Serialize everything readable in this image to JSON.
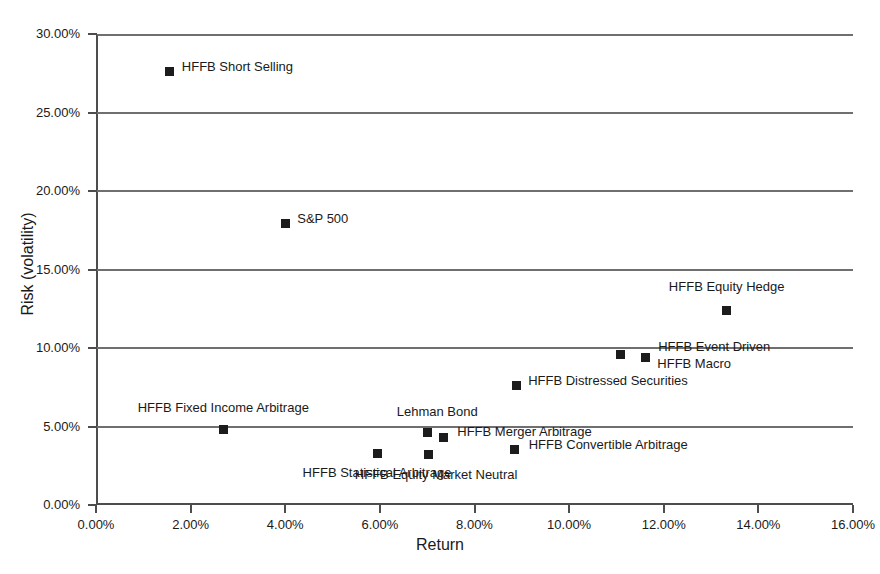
{
  "chart_data": {
    "type": "scatter",
    "title": "",
    "xlabel": "Return",
    "ylabel": "Risk (volatility)",
    "xlim": [
      0,
      16
    ],
    "ylim": [
      0,
      30
    ],
    "grid": "horizontal",
    "legend": "none",
    "x_tick_labels": [
      "0.00%",
      "2.00%",
      "4.00%",
      "6.00%",
      "8.00%",
      "10.00%",
      "12.00%",
      "14.00%",
      "16.00%"
    ],
    "x_tick_values": [
      0,
      2,
      4,
      6,
      8,
      10,
      12,
      14,
      16
    ],
    "y_tick_labels": [
      "0.00%",
      "5.00%",
      "10.00%",
      "15.00%",
      "20.00%",
      "25.00%",
      "30.00%"
    ],
    "y_tick_values": [
      0,
      5,
      10,
      15,
      20,
      25,
      30
    ],
    "marker_color": "#1c1c1c",
    "axis_color": "#4d4d4d",
    "points": [
      {
        "name": "HFFB Short Selling",
        "x": 1.56,
        "y": 27.6,
        "label": "HFFB Short Selling",
        "label_anchor": "left",
        "label_dx": 12,
        "label_dy": -6
      },
      {
        "name": "S&P 500",
        "x": 4.0,
        "y": 17.9,
        "label": "S&P 500",
        "label_anchor": "left",
        "label_dx": 12,
        "label_dy": -6
      },
      {
        "name": "HFFB Equity Hedge",
        "x": 13.33,
        "y": 12.4,
        "label": "HFFB Equity Hedge",
        "label_anchor": "mid",
        "label_dx": 0,
        "label_dy": -24
      },
      {
        "name": "HFFB Event Driven",
        "x": 11.08,
        "y": 9.6,
        "label": "HFFB Event Driven",
        "label_anchor": "left",
        "label_dx": 38,
        "label_dy": -8
      },
      {
        "name": "HFFB Macro",
        "x": 11.61,
        "y": 9.4,
        "label": "HFFB Macro",
        "label_anchor": "left",
        "label_dx": 12,
        "label_dy": 6
      },
      {
        "name": "HFFB Distressed Securities",
        "x": 8.88,
        "y": 7.6,
        "label": "HFFB Distressed Securities",
        "label_anchor": "left",
        "label_dx": 12,
        "label_dy": -6
      },
      {
        "name": "HFFB Fixed Income Arbitrage",
        "x": 2.69,
        "y": 4.8,
        "label": "HFFB Fixed Income Arbitrage",
        "label_anchor": "mid",
        "label_dx": 0,
        "label_dy": -23
      },
      {
        "name": "Lehman Bond",
        "x": 7.0,
        "y": 4.6,
        "label": "Lehman Bond",
        "label_anchor": "mid",
        "label_dx": 10,
        "label_dy": -22
      },
      {
        "name": "HFFB Merger Arbitrage",
        "x": 7.34,
        "y": 4.3,
        "label": "HFFB Merger Arbitrage",
        "label_anchor": "left",
        "label_dx": 14,
        "label_dy": -6
      },
      {
        "name": "HFFB Convertible Arbitrage",
        "x": 8.85,
        "y": 3.55,
        "label": "HFFB Convertible Arbitrage",
        "label_anchor": "left",
        "label_dx": 14,
        "label_dy": -5
      },
      {
        "name": "HFFB Equity Market Neutral",
        "x": 7.02,
        "y": 3.2,
        "label": "HFFB Equity Market Neutral",
        "label_anchor": "mid",
        "label_dx": 8,
        "label_dy": 19
      },
      {
        "name": "HFFB Statistical Arbitrage",
        "x": 5.94,
        "y": 3.3,
        "label": "HFFB Statistical Arbitrage",
        "label_anchor": "mid",
        "label_dx": 0,
        "label_dy": 19
      }
    ]
  }
}
